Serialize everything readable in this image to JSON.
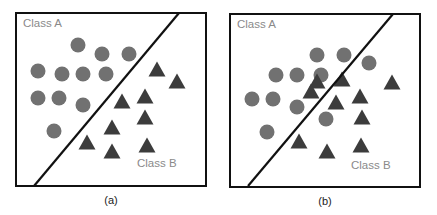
{
  "colors": {
    "circle": "#717171",
    "triangle": "#3c3c3c",
    "frame": "#111111",
    "boundary": "#111111",
    "label": "#8a8a8a"
  },
  "panels": [
    {
      "caption": "(a)",
      "class_a_label": "Class A",
      "class_b_label": "Class B",
      "frame": {
        "x": 16,
        "y": 13,
        "w": 190,
        "h": 173
      },
      "boundary": {
        "x1": 34,
        "y1": 186,
        "x2": 179,
        "y2": 13
      },
      "class_a_label_pos": {
        "x": 23,
        "y": 27
      },
      "class_b_label_pos": {
        "x": 137,
        "y": 167
      },
      "caption_pos": {
        "x": 111,
        "y": 204
      },
      "circles": [
        [
          78,
          45
        ],
        [
          102,
          54
        ],
        [
          129,
          54
        ],
        [
          38,
          71
        ],
        [
          62,
          74
        ],
        [
          83,
          74
        ],
        [
          106,
          74
        ],
        [
          38,
          98
        ],
        [
          59,
          98
        ],
        [
          83,
          105
        ],
        [
          54,
          131
        ]
      ],
      "triangles": [
        [
          157,
          70
        ],
        [
          177,
          82
        ],
        [
          122,
          102
        ],
        [
          145,
          97
        ],
        [
          145,
          118
        ],
        [
          112,
          128
        ],
        [
          87,
          143
        ],
        [
          112,
          152
        ],
        [
          147,
          146
        ]
      ]
    },
    {
      "caption": "(b)",
      "class_a_label": "Class A",
      "class_b_label": "Class B",
      "frame": {
        "x": 230,
        "y": 14,
        "w": 190,
        "h": 173
      },
      "boundary": {
        "x1": 248,
        "y1": 186,
        "x2": 393,
        "y2": 14
      },
      "class_a_label_pos": {
        "x": 237,
        "y": 28
      },
      "class_b_label_pos": {
        "x": 351,
        "y": 169
      },
      "caption_pos": {
        "x": 325,
        "y": 205
      },
      "circles": [
        [
          317,
          55
        ],
        [
          344,
          55
        ],
        [
          369,
          63
        ],
        [
          276,
          75
        ],
        [
          297,
          75
        ],
        [
          321,
          75
        ],
        [
          252,
          99
        ],
        [
          273,
          99
        ],
        [
          297,
          107
        ],
        [
          326,
          119
        ],
        [
          267,
          132
        ]
      ],
      "triangles": [
        [
          317,
          82
        ],
        [
          392,
          83
        ],
        [
          342,
          80
        ],
        [
          311,
          92
        ],
        [
          336,
          103
        ],
        [
          360,
          97
        ],
        [
          362,
          118
        ],
        [
          299,
          142
        ],
        [
          327,
          152
        ],
        [
          361,
          146
        ]
      ]
    }
  ]
}
